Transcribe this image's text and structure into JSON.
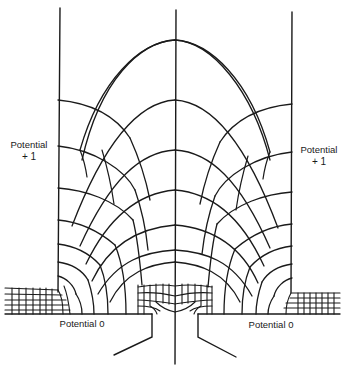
{
  "diagram": {
    "type": "flux-plot",
    "colors": {
      "line": "#1a1a1a",
      "background": "#ffffff"
    },
    "labels": {
      "left_top": {
        "line1": "Potential",
        "line2": "+ 1"
      },
      "right_top": {
        "line1": "Potential",
        "line2": "+ 1"
      },
      "left_bottom": "Potential 0",
      "right_bottom": "Potential 0"
    }
  }
}
